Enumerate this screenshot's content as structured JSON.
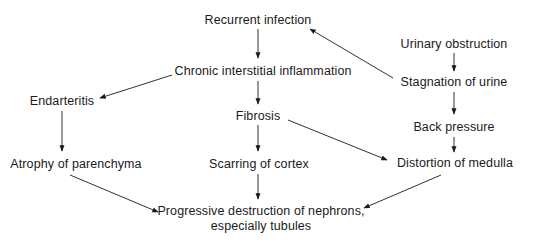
{
  "diagram": {
    "type": "flowchart",
    "nodes": {
      "recurrent_infection": "Recurrent infection",
      "urinary_obstruction": "Urinary obstruction",
      "chronic_inflammation": "Chronic interstitial inflammation",
      "stagnation_of_urine": "Stagnation of urine",
      "endarteritis": "Endarteritis",
      "fibrosis": "Fibrosis",
      "back_pressure": "Back pressure",
      "atrophy": "Atrophy of parenchyma",
      "scarring": "Scarring of cortex",
      "distortion": "Distortion of medulla",
      "destruction_line1": "Progressive destruction of nephrons,",
      "destruction_line2": "especially tubules"
    },
    "edges": [
      {
        "from": "Recurrent infection",
        "to": "Chronic interstitial inflammation"
      },
      {
        "from": "Stagnation of urine",
        "to": "Recurrent infection"
      },
      {
        "from": "Urinary obstruction",
        "to": "Stagnation of urine"
      },
      {
        "from": "Chronic interstitial inflammation",
        "to": "Endarteritis"
      },
      {
        "from": "Chronic interstitial inflammation",
        "to": "Fibrosis"
      },
      {
        "from": "Stagnation of urine",
        "to": "Back pressure"
      },
      {
        "from": "Endarteritis",
        "to": "Atrophy of parenchyma"
      },
      {
        "from": "Fibrosis",
        "to": "Scarring of cortex"
      },
      {
        "from": "Fibrosis",
        "to": "Distortion of medulla"
      },
      {
        "from": "Back pressure",
        "to": "Distortion of medulla"
      },
      {
        "from": "Atrophy of parenchyma",
        "to": "Progressive destruction of nephrons, especially tubules"
      },
      {
        "from": "Scarring of cortex",
        "to": "Progressive destruction of nephrons, especially tubules"
      },
      {
        "from": "Distortion of medulla",
        "to": "Progressive destruction of nephrons, especially tubules"
      }
    ],
    "colors": {
      "text": "#1a1a1a",
      "arrow": "#1a1a1a",
      "background": "#ffffff"
    }
  }
}
